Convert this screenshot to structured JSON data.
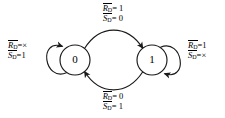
{
  "diagram": {
    "type": "state-transition-diagram",
    "title": "",
    "states": [
      {
        "id": "s0",
        "label": "0",
        "cx": 75,
        "cy": 60,
        "r": 15
      },
      {
        "id": "s1",
        "label": "1",
        "cx": 152,
        "cy": 60,
        "r": 15
      }
    ],
    "transitions": [
      {
        "id": "t-0-to-1",
        "from": "0",
        "to": "1",
        "kind": "arc-top",
        "label": {
          "line1_var": "R",
          "line1_sub": "D",
          "line1_eq": "=",
          "line1_val": "1",
          "line2_var": "S",
          "line2_sub": "D",
          "line2_eq": "=",
          "line2_val": "0"
        }
      },
      {
        "id": "t-1-to-0",
        "from": "1",
        "to": "0",
        "kind": "arc-bottom",
        "label": {
          "line1_var": "R",
          "line1_sub": "D",
          "line1_eq": "=",
          "line1_val": "0",
          "line2_var": "S",
          "line2_sub": "D",
          "line2_eq": "=",
          "line2_val": "1"
        }
      },
      {
        "id": "t-0-self",
        "from": "0",
        "to": "0",
        "kind": "self-loop-left",
        "label": {
          "line1_var": "R",
          "line1_sub": "D",
          "line1_eq": "=",
          "line1_val": "×",
          "line2_var": "S",
          "line2_sub": "D",
          "line2_eq": "=",
          "line2_val": "1"
        }
      },
      {
        "id": "t-1-self",
        "from": "1",
        "to": "1",
        "kind": "self-loop-right",
        "label": {
          "line1_var": "R",
          "line1_sub": "D",
          "line1_eq": "=",
          "line1_val": "1",
          "line2_var": "S",
          "line2_sub": "D",
          "line2_eq": "=",
          "line2_val": "×"
        }
      }
    ],
    "colors": {
      "stroke": "#1a1a1a",
      "text": "#000000",
      "background": "#ffffff"
    }
  }
}
